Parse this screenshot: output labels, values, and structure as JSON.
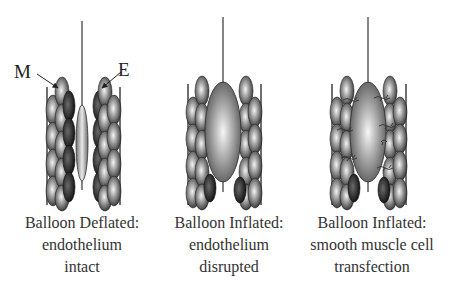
{
  "figure": {
    "labels": {
      "muscle": "M",
      "endothelium": "E"
    },
    "panels": [
      {
        "id": "deflated",
        "caption": [
          "Balloon Deflated:",
          "endothelium",
          "intact"
        ],
        "balloon_state": "deflated",
        "center_x": 82
      },
      {
        "id": "inflated-disrupted",
        "caption": [
          "Balloon Inflated:",
          "endothelium",
          "disrupted"
        ],
        "balloon_state": "inflated",
        "center_x": 224
      },
      {
        "id": "inflated-transfection",
        "caption": [
          "Balloon Inflated:",
          "smooth muscle cell",
          "transfection"
        ],
        "balloon_state": "inflated",
        "center_x": 369
      }
    ],
    "colors": {
      "line": "#444444",
      "cell_dark": "#2a2a2a",
      "cell_light": "#e8e8e8",
      "balloon_dark": "#555555",
      "balloon_light": "#f2f2f2",
      "text": "#333333"
    }
  }
}
